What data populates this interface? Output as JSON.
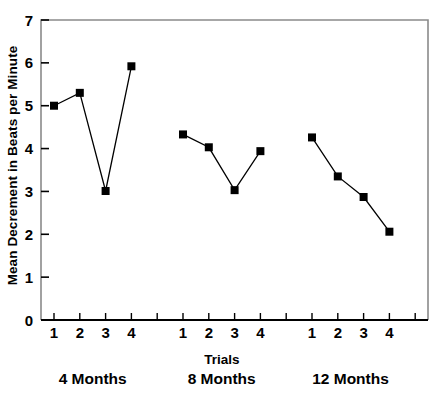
{
  "chart_data": {
    "type": "line",
    "title": "",
    "xlabel": "Trials",
    "ylabel": "Mean Decrement in Beats per Minute",
    "ylim": [
      0,
      7
    ],
    "ytick_labels": [
      "0",
      "1",
      "2",
      "3",
      "4",
      "5",
      "6",
      "7"
    ],
    "ytick_values": [
      0,
      1,
      2,
      3,
      4,
      5,
      6,
      7
    ],
    "grid": false,
    "legend": "none",
    "marker": "filled-square",
    "marker_color": "#000000",
    "line_color": "#000000",
    "categories": [
      "1",
      "2",
      "3",
      "4"
    ],
    "groups": [
      {
        "name": "4 Months",
        "label": "4 Months",
        "trials": [
          "1",
          "2",
          "3",
          "4"
        ],
        "values": [
          5.0,
          5.3,
          3.01,
          5.92
        ]
      },
      {
        "name": "8 Months",
        "label": "8 Months",
        "trials": [
          "1",
          "2",
          "3",
          "4"
        ],
        "values": [
          4.33,
          4.03,
          3.03,
          3.94
        ]
      },
      {
        "name": "12 Months",
        "label": "12 Months",
        "trials": [
          "1",
          "2",
          "3",
          "4"
        ],
        "values": [
          4.26,
          3.35,
          2.87,
          2.06
        ]
      }
    ],
    "series": [
      {
        "name": "4 Months",
        "values": [
          5.0,
          5.3,
          3.01,
          5.92
        ]
      },
      {
        "name": "8 Months",
        "values": [
          4.33,
          4.03,
          3.03,
          3.94
        ]
      },
      {
        "name": "12 Months",
        "values": [
          4.26,
          3.35,
          2.87,
          2.06
        ]
      }
    ]
  },
  "axis": {
    "y_title": "Mean Decrement in Beats per Minute",
    "x_title": "Trials"
  },
  "group_labels": {
    "g1": "4 Months",
    "g2": "8 Months",
    "g3": "12 Months"
  }
}
